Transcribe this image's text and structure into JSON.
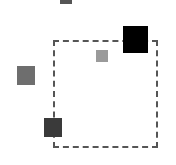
{
  "canvas": {
    "width": 176,
    "height": 165,
    "background": "#ffffff"
  },
  "selection_rect": {
    "x": 53,
    "y": 40,
    "width": 105,
    "height": 108,
    "border_color": "#555555",
    "style": "dashed"
  },
  "squares": [
    {
      "id": "top-clipped",
      "x": 60,
      "y": 0,
      "width": 12,
      "height": 4,
      "color": "#555555"
    },
    {
      "id": "large-black",
      "x": 123,
      "y": 26,
      "width": 25,
      "height": 27,
      "color": "#000000"
    },
    {
      "id": "small-light",
      "x": 96,
      "y": 50,
      "width": 12,
      "height": 12,
      "color": "#9a9a9a"
    },
    {
      "id": "left-gray",
      "x": 17,
      "y": 66,
      "width": 18,
      "height": 19,
      "color": "#6e6e6e"
    },
    {
      "id": "bottom-dark",
      "x": 44,
      "y": 118,
      "width": 18,
      "height": 19,
      "color": "#3a3a3a"
    }
  ]
}
